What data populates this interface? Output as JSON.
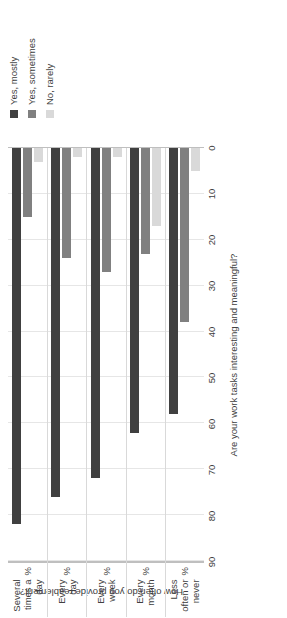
{
  "chart_data": {
    "type": "bar",
    "orientation": "horizontal-grouped",
    "title": "",
    "xlabel": "How often do you provide reablement?",
    "ylabel": "Are your work tasks interesting and meaningful?",
    "categories": [
      "Several times a day",
      "Every day",
      "Every week",
      "Every month",
      "Less often or never"
    ],
    "category_unit": "%",
    "series": [
      {
        "name": "Yes, mostly",
        "color": "#404040",
        "values": [
          82,
          76,
          72,
          62,
          58
        ]
      },
      {
        "name": "Yes, sometimes",
        "color": "#808080",
        "values": [
          15,
          24,
          27,
          23,
          38
        ]
      },
      {
        "name": "No, rarely",
        "color": "#d9d9d9",
        "values": [
          3,
          2,
          2,
          17,
          5
        ]
      }
    ],
    "ylim": [
      0,
      90
    ],
    "yticks": [
      0,
      10,
      20,
      30,
      40,
      50,
      60,
      70,
      80,
      90
    ],
    "ytick_labels": [
      "0",
      "10",
      "20",
      "30",
      "40",
      "50",
      "60",
      "70",
      "80",
      "90"
    ],
    "grid": true,
    "legend_position": "right"
  },
  "legend": {
    "items": [
      {
        "label": "Yes, mostly",
        "color": "#404040"
      },
      {
        "label": "Yes, sometimes",
        "color": "#808080"
      },
      {
        "label": "No, rarely",
        "color": "#d9d9d9"
      }
    ]
  },
  "axes": {
    "value_axis_title": "Are your work tasks interesting and meaningful?",
    "category_axis_title": "How often do you provide reablement?",
    "unit_label": "%"
  }
}
